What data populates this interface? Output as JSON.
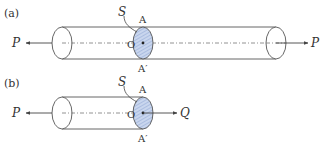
{
  "colors": {
    "line": "#555555",
    "shade_fill": "#c9d6ee",
    "hatch": "#8ea4d2",
    "text": "#333333"
  },
  "diagram_a": {
    "label": "(a)",
    "surface_label": "S",
    "point_top": "A",
    "point_center": "O",
    "point_bottom": "A′",
    "left_force": "P",
    "right_force": "P"
  },
  "diagram_b": {
    "label": "(b)",
    "surface_label": "S",
    "point_top": "A",
    "point_center": "O",
    "point_bottom": "A′",
    "left_force": "P",
    "right_force": "Q"
  }
}
